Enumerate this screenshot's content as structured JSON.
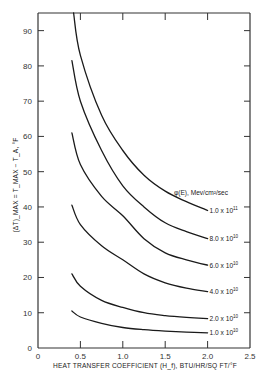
{
  "chart_data": {
    "type": "line",
    "title": "",
    "xlabel": "HEAT TRANSFER COEFFICIENT (H_f), BTU/HR/SQ FT/°F",
    "ylabel": "(ΔT)_MAX = T_MAX − T_A, °F",
    "xlim": [
      0,
      2.5
    ],
    "ylim": [
      0,
      95
    ],
    "grid": false,
    "x_ticks": [
      0,
      0.5,
      1.0,
      1.5,
      2.0,
      2.5
    ],
    "x_tick_labels": [
      "0",
      "0.5",
      "1.0",
      "1.5",
      "2.0",
      "2.5"
    ],
    "y_ticks": [
      0,
      10,
      20,
      30,
      40,
      50,
      60,
      70,
      80,
      90
    ],
    "y_tick_labels": [
      "0",
      "10",
      "20",
      "30",
      "40",
      "50",
      "60",
      "70",
      "80",
      "90"
    ],
    "legend_title": "φ(E), Mev/cm²/sec",
    "legend_position": "inline labels at right end of curves",
    "series": [
      {
        "name": "1.0 x 10^11",
        "label_base": "1.0 x 10",
        "label_exp": "11",
        "x": [
          0.42,
          0.5,
          0.75,
          1.0,
          1.25,
          1.5,
          1.75,
          2.0
        ],
        "values": [
          95,
          83,
          66,
          56,
          49,
          44.5,
          41.5,
          39
        ]
      },
      {
        "name": "8.0 x 10^10",
        "label_base": "8.0 x 10",
        "label_exp": "10",
        "x": [
          0.4,
          0.5,
          0.75,
          1.0,
          1.25,
          1.5,
          1.75,
          2.0
        ],
        "values": [
          81.5,
          70,
          56,
          46,
          40,
          35.5,
          33,
          31
        ]
      },
      {
        "name": "6.0 x 10^10",
        "label_base": "6.0 x 10",
        "label_exp": "10",
        "x": [
          0.4,
          0.5,
          0.75,
          1.0,
          1.25,
          1.5,
          1.75,
          2.0
        ],
        "values": [
          61,
          52,
          43,
          37.5,
          31,
          27,
          25,
          23.5
        ]
      },
      {
        "name": "4.0 x 10^10",
        "label_base": "4.0 x 10",
        "label_exp": "10",
        "x": [
          0.4,
          0.5,
          0.75,
          1.0,
          1.25,
          1.5,
          1.75,
          2.0
        ],
        "values": [
          40.5,
          35,
          29,
          25,
          21,
          18.5,
          17,
          16
        ]
      },
      {
        "name": "2.0 x 10^10",
        "label_base": "2.0 x 10",
        "label_exp": "10",
        "x": [
          0.4,
          0.5,
          0.75,
          1.0,
          1.25,
          1.5,
          1.75,
          2.0
        ],
        "values": [
          21,
          17.5,
          13.5,
          11.5,
          10,
          9.2,
          8.7,
          8.3
        ]
      },
      {
        "name": "1.0 x 10^10",
        "label_base": "1.0 x 10",
        "label_exp": "10",
        "x": [
          0.4,
          0.5,
          0.75,
          1.0,
          1.25,
          1.5,
          1.75,
          2.0
        ],
        "values": [
          10.5,
          8.8,
          7.0,
          5.8,
          5.2,
          4.8,
          4.5,
          4.3
        ]
      }
    ],
    "colors": {
      "line": "#1a1a1a",
      "axis": "#333333",
      "background": "#ffffff"
    }
  }
}
